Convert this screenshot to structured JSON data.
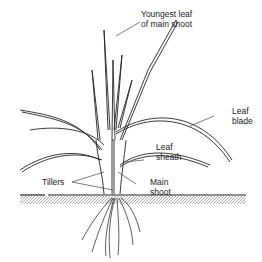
{
  "diagram": {
    "labels": {
      "youngest_leaf_line1": "Youngest leaf",
      "youngest_leaf_line2": "of main shoot",
      "leaf_blade_line1": "Leaf",
      "leaf_blade_line2": "blade",
      "leaf_sheath_line1": "Leaf",
      "leaf_sheath_line2": "sheath",
      "tillers": "Tillers",
      "main_shoot_line1": "Main",
      "main_shoot_line2": "shoot"
    },
    "colors": {
      "ink": "#222222",
      "soil": "#b0b0b0",
      "background": "#ffffff"
    }
  }
}
